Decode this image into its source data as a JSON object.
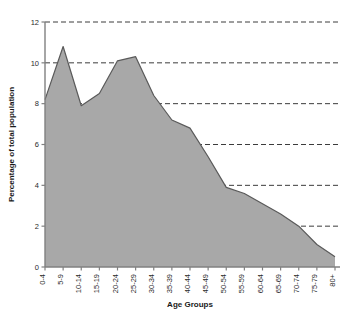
{
  "chart_data": {
    "type": "area",
    "title": "",
    "xlabel": "Age Groups",
    "ylabel": "Percentage of total population",
    "categories": [
      "0-4",
      "5-9",
      "10-14",
      "15-19",
      "20-24",
      "25-29",
      "30-34",
      "35-39",
      "40-44",
      "45-49",
      "50-54",
      "55-59",
      "60-64",
      "65-69",
      "70-74",
      "75-79",
      "80+"
    ],
    "values": [
      8.2,
      10.8,
      7.9,
      8.5,
      10.1,
      10.3,
      8.4,
      7.2,
      6.8,
      5.4,
      3.9,
      3.6,
      3.1,
      2.6,
      2.0,
      1.1,
      0.5
    ],
    "ylim": [
      0,
      12
    ],
    "yticks": [
      0,
      2,
      4,
      6,
      8,
      10,
      12
    ],
    "ytick_labels": [
      "0",
      "2",
      "4",
      "6",
      "8",
      "10",
      "12"
    ],
    "grid": "horizontal-dashed",
    "legend": "none",
    "series_fill_color": "#a8a8a8",
    "series_line_color": "#5a5a5a",
    "axis_color": "#808080",
    "grid_color": "#3c3c3c"
  }
}
